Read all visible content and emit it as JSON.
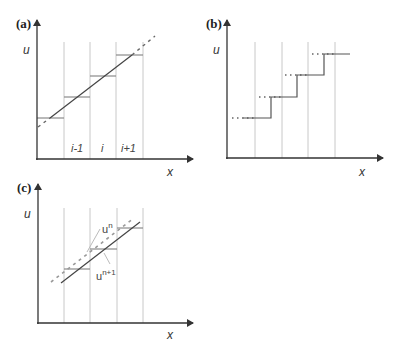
{
  "figure": {
    "panels": [
      {
        "id": "a",
        "label": "(a)",
        "y_axis_label": "u",
        "x_axis_label": "x",
        "cell_labels": [
          "i-1",
          "i",
          "i+1"
        ],
        "description": "Piecewise-constant cell averages with linear reconstruction line"
      },
      {
        "id": "b",
        "label": "(b)",
        "y_axis_label": "u",
        "x_axis_label": "x",
        "description": "Staircase of cell averages with dotted extensions"
      },
      {
        "id": "c",
        "label": "(c)",
        "y_axis_label": "u",
        "x_axis_label": "x",
        "curve_labels": {
          "un": {
            "base": "u",
            "sup": "n"
          },
          "un1": {
            "base": "u",
            "sup": "n+1"
          }
        },
        "description": "Solution at time level n (dashed) and n+1 (solid)"
      }
    ]
  }
}
